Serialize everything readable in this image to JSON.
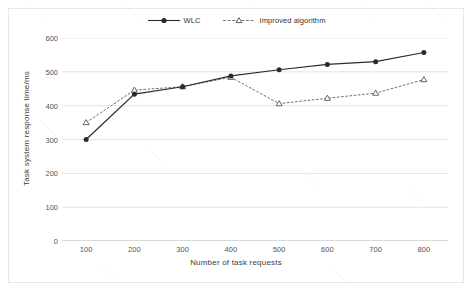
{
  "chart_data": {
    "type": "line",
    "title": "",
    "xlabel": "Number of task requests",
    "ylabel": "Task system response time/ms",
    "x": [
      100,
      200,
      300,
      400,
      500,
      600,
      700,
      800
    ],
    "xtick_labels": [
      "100",
      "200",
      "300",
      "400",
      "500",
      "600",
      "700",
      "800"
    ],
    "ytick_labels": [
      "0",
      "100",
      "200",
      "300",
      "400",
      "500",
      "600"
    ],
    "yticks": [
      0,
      100,
      200,
      300,
      400,
      500,
      600
    ],
    "ylim": [
      0,
      600
    ],
    "xlim": [
      50,
      850
    ],
    "grid": "horizontal",
    "legend_position": "top-center",
    "series": [
      {
        "name": "WLC",
        "marker": "filled-circle",
        "line_style": "solid",
        "color": "#2b2b2b",
        "values": [
          300,
          434,
          456,
          488,
          506,
          522,
          530,
          557
        ]
      },
      {
        "name": "Improved algorithm",
        "marker": "triangle",
        "line_style": "dotted",
        "color": "#707070",
        "values": [
          350,
          446,
          456,
          484,
          406,
          422,
          437,
          477
        ]
      }
    ]
  },
  "legend": {
    "entries": [
      {
        "label": "WLC",
        "marker_icon": "filled-circle-marker"
      },
      {
        "label": "Improved algorithm",
        "marker_icon": "triangle-marker"
      }
    ]
  },
  "axes": {
    "x_title": "Number of task requests",
    "y_title": "Task system response time/ms"
  }
}
